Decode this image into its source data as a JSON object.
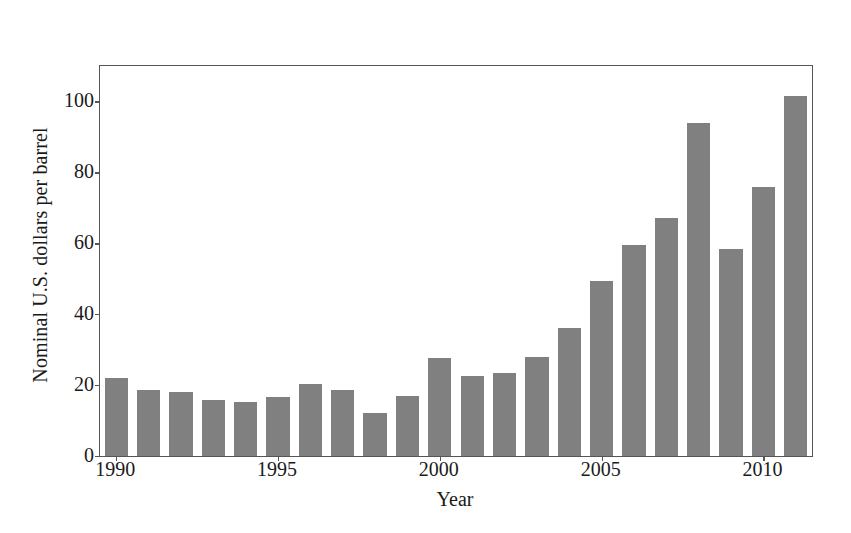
{
  "chart_data": {
    "type": "bar",
    "title": "",
    "subtitle": "",
    "xlabel": "Year",
    "ylabel": "Nominal U.S. dollars per barrel",
    "categories": [
      "1990",
      "1991",
      "1992",
      "1993",
      "1994",
      "1995",
      "1996",
      "1997",
      "1998",
      "1999",
      "2000",
      "2001",
      "2002",
      "2003",
      "2004",
      "2005",
      "2006",
      "2007",
      "2008",
      "2009",
      "2010",
      "2011"
    ],
    "values": [
      22.0,
      18.6,
      18.0,
      15.9,
      15.2,
      16.7,
      20.2,
      18.5,
      12.0,
      16.9,
      27.6,
      22.6,
      23.4,
      28.0,
      36.0,
      49.5,
      59.5,
      67.0,
      94.0,
      58.5,
      76.0,
      101.5
    ],
    "series": [
      {
        "name": "Crude oil price",
        "values": [
          22.0,
          18.6,
          18.0,
          15.9,
          15.2,
          16.7,
          20.2,
          18.5,
          12.0,
          16.9,
          27.6,
          22.6,
          23.4,
          28.0,
          36.0,
          49.5,
          59.5,
          67.0,
          94.0,
          58.5,
          76.0,
          101.5
        ],
        "color": "#808080"
      }
    ],
    "ylim": [
      0,
      110
    ],
    "xlim": [
      1989.5,
      2011.5
    ],
    "yticks": [
      0,
      20,
      40,
      60,
      80,
      100
    ],
    "ytick_labels": [
      "0",
      "20",
      "40",
      "60",
      "80",
      "100"
    ],
    "xticks": [
      1990,
      1995,
      2000,
      2005,
      2010
    ],
    "xtick_labels": [
      "1990",
      "1995",
      "2000",
      "2005",
      "2010"
    ],
    "grid": false,
    "legend": false,
    "legend_position": "none",
    "bar_color": "#808080",
    "frame_color": "#555555",
    "background": "#ffffff",
    "annotations": []
  }
}
